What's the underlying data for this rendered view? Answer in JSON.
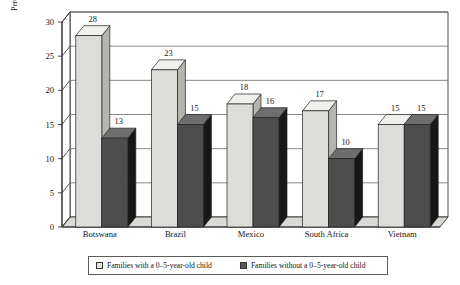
{
  "chart_data": {
    "type": "bar",
    "title": "",
    "subtitle": "",
    "xlabel": "",
    "ylabel": "Percentage of Households with at Least One\nChild Not Enrolled in School",
    "categories": [
      "Botswana",
      "Brazil",
      "Mexico",
      "South Africa",
      "Vietnam"
    ],
    "series": [
      {
        "name": "Families with a 0–5-year-old child",
        "color": "#dcdcd8",
        "values": [
          28,
          23,
          18,
          17,
          15
        ]
      },
      {
        "name": "Families without a 0–5-year-old child",
        "color": "#4d4d4d",
        "values": [
          13,
          15,
          16,
          10,
          15
        ]
      }
    ],
    "ylim": [
      0,
      30
    ],
    "yticks": [
      0,
      5,
      10,
      15,
      20,
      25,
      30
    ],
    "ytick_labels": [
      "0",
      "5",
      "10",
      "15",
      "20",
      "25",
      "30"
    ],
    "grid": true,
    "grid_axis": "y",
    "legend_position": "bottom",
    "style": "3d-column",
    "data_labels": true
  },
  "legend": {
    "items": [
      {
        "label": "Families with a 0–5-year-old child",
        "swatch": "light"
      },
      {
        "label": "Families without a 0–5-year-old child",
        "swatch": "dark"
      }
    ]
  },
  "colors": {
    "light_bar_front": "#dcdcd8",
    "light_bar_top": "#f0f0ec",
    "light_bar_side": "#b5b5b0",
    "dark_bar_front": "#4d4d4d",
    "dark_bar_top": "#6e6e6e",
    "dark_bar_side": "#171717",
    "axis": "#333333",
    "grid": "#6b6b6b",
    "floor": "#d9d9d5",
    "text": "#151515"
  }
}
